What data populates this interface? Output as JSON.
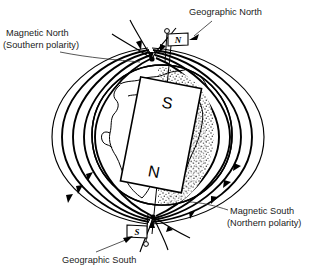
{
  "diagram": {
    "background_color": "#ffffff",
    "ink_color": "#000000"
  },
  "labels": {
    "magnetic_north": {
      "line1": "Magnetic North",
      "line2": "(Southern polarity)",
      "position": "top-left"
    },
    "geographic_north": {
      "text": "Geographic North",
      "position": "top-right"
    },
    "magnetic_south": {
      "line1": "Magnetic South",
      "line2": "(Northern polarity)",
      "position": "bottom-right"
    },
    "geographic_south": {
      "text": "Geographic South",
      "position": "bottom-left"
    }
  },
  "magnet": {
    "top_pole": "S",
    "bottom_pole": "N",
    "tilt_degrees": 11,
    "fill": "#ffffff"
  },
  "flags": {
    "north_flag_letter": "N",
    "south_flag_letter": "S"
  },
  "globe": {
    "shaded_hemisphere": "right",
    "outline_hemisphere": "left",
    "stipple_color": "#3a3a3a"
  },
  "field_lines": {
    "loop_count": 5,
    "converge_north": "magnetic north pole",
    "converge_south": "magnetic south pole",
    "flow_direction": "into magnetic north, out of magnetic south"
  }
}
